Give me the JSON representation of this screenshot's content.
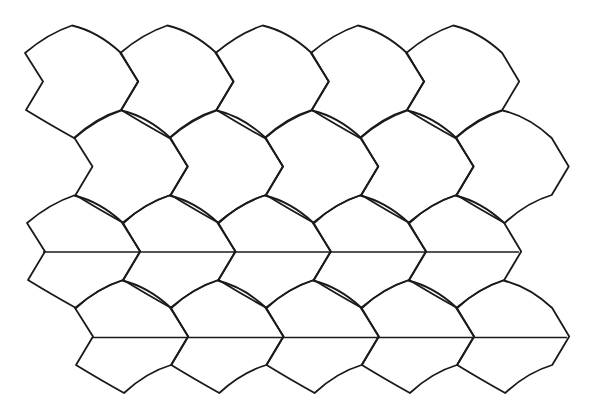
{
  "diagram": {
    "type": "tessellation",
    "stroke_color": "#1a1a1a",
    "background": "#ffffff",
    "tile_shape": {
      "vertices": {
        "top": [
          0,
          0
        ],
        "right_top": [
          49,
          27.5
        ],
        "right_point": [
          66,
          56
        ],
        "right_bottom": [
          49,
          84.5
        ],
        "bottom": [
          2,
          112.5
        ],
        "left_bottom": [
          -46,
          84.5
        ],
        "left_notch": [
          -29,
          56
        ],
        "left_top": [
          -47,
          27.5
        ]
      },
      "curve_controls": {
        "top_to_right_top": [
          26,
          6
        ],
        "right_bottom_to_bottom": [
          24,
          92
        ],
        "bottom_to_left_bottom": [
          -24,
          98
        ],
        "left_top_to_top": [
          -24,
          8
        ]
      }
    },
    "rows": [
      {
        "origin_x": 72,
        "origin_y": 25.5,
        "count": 5,
        "period": 95.3
      },
      {
        "origin_x": 121.5,
        "origin_y": 110.5,
        "count": 5,
        "period": 95.3
      },
      {
        "origin_x": 74,
        "origin_y": 195.5,
        "count": 5,
        "period": 95.3
      },
      {
        "origin_x": 122,
        "origin_y": 280.5,
        "count": 5,
        "period": 95.3
      }
    ],
    "horizontal_lines": [
      {
        "x1": 43,
        "x2": 519,
        "y": 252
      },
      {
        "x1": 92,
        "x2": 567,
        "y": 337.5
      }
    ]
  }
}
